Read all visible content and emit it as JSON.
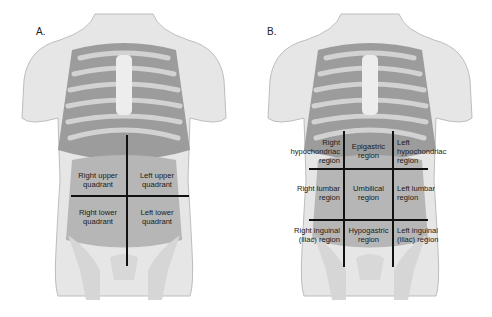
{
  "panels": {
    "a": {
      "label": "A.",
      "title": "Four abdominal quadrants",
      "regions": {
        "ruq": [
          "Right upper",
          "quadrant"
        ],
        "luq": [
          "Left upper",
          "quadrant"
        ],
        "rlq": [
          "Right lower",
          "quadrant"
        ],
        "llq": [
          "Left lower",
          "quadrant"
        ]
      }
    },
    "b": {
      "label": "B.",
      "title": "Nine abdominal regions",
      "regions": {
        "right_hypochondriac": [
          "Right",
          "hypochondriac",
          "region"
        ],
        "epigastric": [
          "Epigastric",
          "region"
        ],
        "left_hypochondriac": [
          "Left",
          "hypochondriac",
          "region"
        ],
        "right_lumbar": [
          "Right lumbar",
          "region"
        ],
        "umbilical": [
          "Umbilical",
          "region"
        ],
        "left_lumbar": [
          "Left lumbar",
          "region"
        ],
        "right_inguinal": [
          "Right inguinal",
          "(iliac) region"
        ],
        "hypogastric": [
          "Hypogastric",
          "region"
        ],
        "left_inguinal": [
          "Left inguinal",
          "(iliac) region"
        ]
      }
    }
  },
  "colors": {
    "skin": "#e6e6e6",
    "skin_outline": "#bdbdbd",
    "rib": "#d2d2d2",
    "organ": "#a9a9a9",
    "divider": "#111111"
  }
}
